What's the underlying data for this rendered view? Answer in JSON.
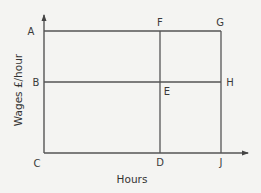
{
  "diagram": {
    "type": "labour-wage-rectangle",
    "axes": {
      "x_label": "Hours",
      "y_label": "Wages £/hour"
    },
    "points": {
      "A": "A",
      "B": "B",
      "C": "C",
      "D": "D",
      "E": "E",
      "F": "F",
      "G": "G",
      "H": "H",
      "J": "J"
    },
    "lines": [
      {
        "from": "A",
        "to": "G"
      },
      {
        "from": "B",
        "to": "H"
      },
      {
        "from": "F",
        "to": "D"
      },
      {
        "from": "G",
        "to": "J"
      },
      {
        "from": "C",
        "to": "J"
      }
    ],
    "colors": {
      "line": "#555555",
      "background": "#f4f4f2",
      "text": "#3a3a3a"
    }
  }
}
